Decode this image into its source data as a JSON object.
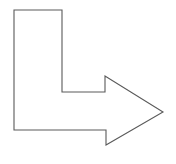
{
  "canvas": {
    "width": 176,
    "height": 164,
    "background_color": "#ffffff",
    "title": "Elbow Arrow"
  },
  "shape": {
    "name": "elbow-arrow-right",
    "description": "L-shaped elbow arrow pointing right",
    "fill_color": "#ffffff",
    "stroke_color": "#5a5a5a",
    "stroke_width": 1.1,
    "direction": "right",
    "points": "14,10 62,10 62,92 105,92 105,76 163,112 106,145 106,130 14,130",
    "vertices": [
      {
        "label": "top-left",
        "x": 14,
        "y": 10
      },
      {
        "label": "top-right",
        "x": 62,
        "y": 10
      },
      {
        "label": "inner-elbow-top",
        "x": 62,
        "y": 92
      },
      {
        "label": "shaft-top-right",
        "x": 105,
        "y": 92
      },
      {
        "label": "barb-top",
        "x": 105,
        "y": 76
      },
      {
        "label": "arrow-tip",
        "x": 163,
        "y": 112
      },
      {
        "label": "barb-bottom",
        "x": 106,
        "y": 145
      },
      {
        "label": "shaft-bottom-right",
        "x": 106,
        "y": 130
      },
      {
        "label": "bottom-left",
        "x": 14,
        "y": 130
      }
    ]
  }
}
